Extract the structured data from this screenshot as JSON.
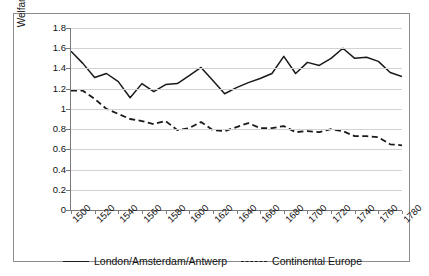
{
  "chart": {
    "type": "line",
    "ylabel": "Welfare ratio",
    "xlabel": ""
  },
  "legend": {
    "items": [
      {
        "label": "London/Amsterdam/Antwerp",
        "style": "solid"
      },
      {
        "label": "Continental Europe",
        "style": "dashed"
      }
    ]
  },
  "yaxis": {
    "ticks": [
      "1.8",
      "1.6",
      "1.4",
      "1.2",
      "1",
      "0.8",
      "0.6",
      "0.4",
      "0.2",
      "0"
    ]
  },
  "xaxis": {
    "ticks": [
      "1500",
      "1520",
      "1540",
      "1560",
      "1580",
      "1600",
      "1620",
      "1640",
      "1660",
      "1680",
      "1700",
      "1720",
      "1740",
      "1760",
      "1780"
    ]
  },
  "chart_data": {
    "type": "line",
    "title": "",
    "xlabel": "",
    "ylabel": "Welfare ratio",
    "xlim": [
      1500,
      1780
    ],
    "ylim": [
      0,
      1.8
    ],
    "ytick_step": 0.2,
    "grid": true,
    "legend_position": "bottom",
    "x": [
      1500,
      1510,
      1520,
      1530,
      1540,
      1550,
      1560,
      1570,
      1580,
      1590,
      1600,
      1610,
      1620,
      1630,
      1640,
      1650,
      1660,
      1670,
      1680,
      1690,
      1700,
      1710,
      1720,
      1730,
      1740,
      1750,
      1760,
      1770,
      1780
    ],
    "series": [
      {
        "name": "London/Amsterdam/Antwerp",
        "style": "solid",
        "color": "#1a1a1a",
        "values": [
          1.57,
          1.45,
          1.31,
          1.35,
          1.27,
          1.11,
          1.25,
          1.17,
          1.24,
          1.25,
          1.33,
          1.41,
          1.28,
          1.15,
          1.21,
          1.26,
          1.3,
          1.35,
          1.52,
          1.35,
          1.46,
          1.43,
          1.5,
          1.6,
          1.5,
          1.51,
          1.47,
          1.36,
          1.32
        ]
      },
      {
        "name": "Continental Europe",
        "style": "dashed",
        "color": "#1a1a1a",
        "values": [
          1.18,
          1.18,
          1.1,
          1.0,
          0.95,
          0.9,
          0.88,
          0.85,
          0.88,
          0.79,
          0.81,
          0.87,
          0.79,
          0.78,
          0.82,
          0.86,
          0.81,
          0.81,
          0.83,
          0.77,
          0.78,
          0.77,
          0.8,
          0.78,
          0.73,
          0.73,
          0.72,
          0.65,
          0.64
        ]
      }
    ]
  }
}
